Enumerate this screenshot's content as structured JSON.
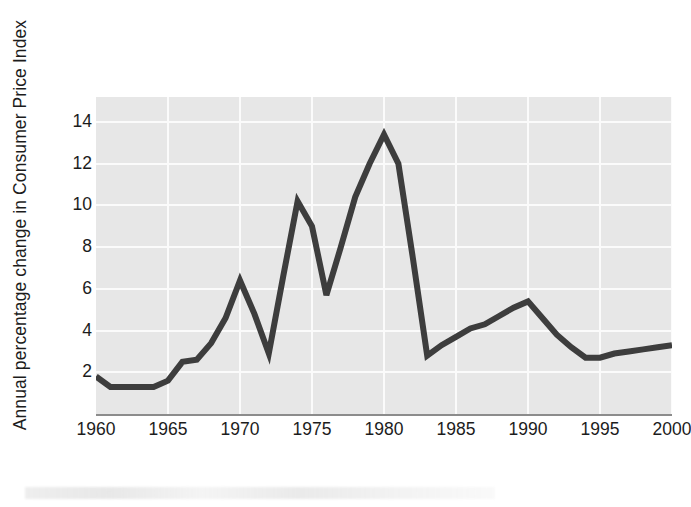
{
  "chart_data": {
    "type": "line",
    "title": "",
    "subtitle": "",
    "xlabel": "",
    "ylabel": "Annual percentage change in Consumer Price Index",
    "xlim": [
      1960,
      2000
    ],
    "ylim": [
      0,
      15.2
    ],
    "xticks": [
      1960,
      1965,
      1970,
      1975,
      1980,
      1985,
      1990,
      1995,
      2000
    ],
    "xtick_labels": [
      "1960",
      "1965",
      "1970",
      "1975",
      "1980",
      "1985",
      "1990",
      "1995",
      "2000"
    ],
    "yticks": [
      2,
      4,
      6,
      8,
      10,
      12,
      14
    ],
    "ytick_labels": [
      "2",
      "4",
      "6",
      "8",
      "10",
      "12",
      "14"
    ],
    "grid": "horizontal-and-vertical-white-on-gray",
    "legend": "none",
    "annotations": [],
    "line_color": "#3d3d3d",
    "line_width": 6,
    "plot_background": "#e7e7e7",
    "grid_color": "#fbfbfb",
    "axis_color": "#8c8c8c",
    "x": [
      1960,
      1961,
      1962,
      1963,
      1964,
      1965,
      1966,
      1967,
      1968,
      1969,
      1970,
      1971,
      1972,
      1973,
      1974,
      1975,
      1976,
      1977,
      1978,
      1979,
      1980,
      1981,
      1982,
      1983,
      1984,
      1985,
      1986,
      1987,
      1988,
      1989,
      1990,
      1991,
      1992,
      1993,
      1994,
      1995,
      1996,
      1997,
      1998,
      1999,
      2000
    ],
    "values": [
      1.8,
      1.3,
      1.3,
      1.3,
      1.3,
      1.6,
      2.5,
      2.6,
      3.4,
      4.6,
      6.4,
      4.8,
      2.9,
      6.6,
      10.2,
      9.0,
      5.7,
      8.0,
      10.4,
      12.0,
      13.4,
      12.0,
      7.5,
      2.8,
      3.3,
      3.7,
      4.1,
      4.3,
      4.7,
      5.1,
      5.4,
      4.6,
      3.8,
      3.2,
      2.7,
      2.7,
      2.9,
      3.0,
      3.1,
      3.2,
      3.3
    ],
    "series": [
      {
        "name": "Annual percentage change in Consumer Price Index",
        "values": [
          1.8,
          1.3,
          1.3,
          1.3,
          1.3,
          1.6,
          2.5,
          2.6,
          3.4,
          4.6,
          6.4,
          4.8,
          2.9,
          6.6,
          10.2,
          9.0,
          5.7,
          8.0,
          10.4,
          12.0,
          13.4,
          12.0,
          7.5,
          2.8,
          3.3,
          3.7,
          4.1,
          4.3,
          4.7,
          5.1,
          5.4,
          4.6,
          3.8,
          3.2,
          2.7,
          2.7,
          2.9,
          3.0,
          3.1,
          3.2,
          3.3
        ]
      }
    ]
  }
}
